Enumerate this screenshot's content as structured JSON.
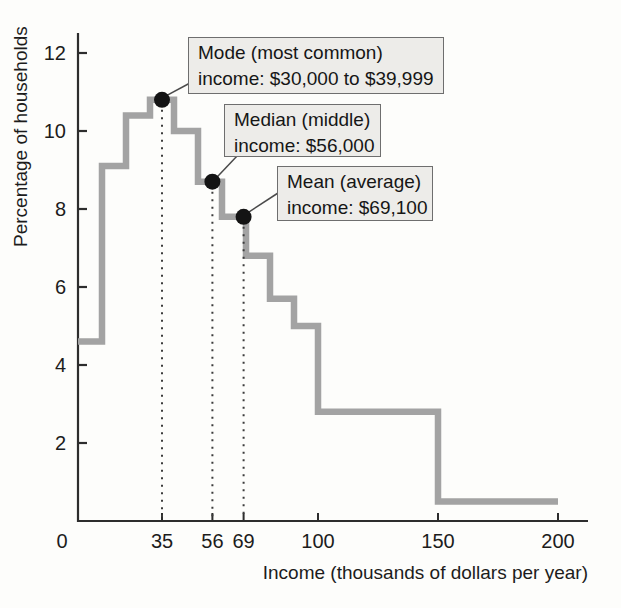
{
  "chart_data": {
    "type": "line",
    "subtype": "step-histogram-outline",
    "title": "",
    "xlabel": "Income (thousands of dollars per year)",
    "ylabel": "Percentage of households",
    "xlim": [
      0,
      200
    ],
    "ylim": [
      0,
      12.5
    ],
    "xticks": [
      0,
      35,
      56,
      69,
      100,
      150,
      200
    ],
    "yticks": [
      2,
      4,
      6,
      8,
      10,
      12
    ],
    "grid": false,
    "legend": "none",
    "line_color": "#a3a3a3",
    "dot_color": "#141414",
    "axis_color": "#2d2d2d",
    "callout_fill": "#edece9",
    "callout_border": "#6e6e6e",
    "bin_edges": [
      0,
      10,
      20,
      30,
      40,
      50,
      60,
      70,
      80,
      90,
      100,
      150,
      200
    ],
    "bin_values": [
      4.6,
      9.1,
      10.4,
      10.8,
      10.0,
      8.7,
      7.8,
      6.8,
      5.7,
      5.0,
      2.8,
      0.5
    ],
    "annotations": [
      {
        "name": "mode",
        "line1": "Mode (most common)",
        "line2": "income: $30,000 to $39,999",
        "x": 35,
        "y": 10.8
      },
      {
        "name": "median",
        "line1": "Median (middle)",
        "line2": "income: $56,000",
        "x": 56,
        "y": 8.7
      },
      {
        "name": "mean",
        "line1": "Mean (average)",
        "line2": "income: $69,100",
        "x": 69,
        "y": 7.8
      }
    ]
  }
}
